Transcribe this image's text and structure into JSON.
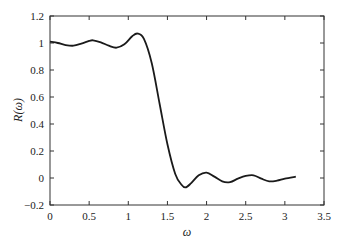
{
  "chart_data": {
    "type": "line",
    "title": "",
    "xlabel": "ω",
    "ylabel": "R(ω)",
    "xlim": [
      0,
      3.5
    ],
    "ylim": [
      -0.2,
      1.2
    ],
    "grid": false,
    "legend": null,
    "xticks": [
      0,
      0.5,
      1,
      1.5,
      2,
      2.5,
      3,
      3.5
    ],
    "xtick_labels": [
      "0",
      "0.5",
      "1",
      "1.5",
      "2",
      "2.5",
      "3",
      "3.5"
    ],
    "yticks": [
      -0.2,
      0,
      0.2,
      0.4,
      0.6,
      0.8,
      1,
      1.2
    ],
    "ytick_labels": [
      "−0.2",
      "0",
      "0.2",
      "0.4",
      "0.6",
      "0.8",
      "1",
      "1.2"
    ],
    "series": [
      {
        "name": "R(ω)",
        "color": "#1a1a1a",
        "x": [
          0,
          0.1,
          0.2,
          0.3,
          0.4,
          0.5,
          0.55,
          0.65,
          0.75,
          0.85,
          0.95,
          1.05,
          1.12,
          1.2,
          1.3,
          1.4,
          1.5,
          1.6,
          1.68,
          1.73,
          1.8,
          1.9,
          2.0,
          2.1,
          2.2,
          2.3,
          2.4,
          2.5,
          2.6,
          2.7,
          2.8,
          2.9,
          3.0,
          3.14
        ],
        "y": [
          1.01,
          1.0,
          0.985,
          0.98,
          0.995,
          1.015,
          1.02,
          1.005,
          0.98,
          0.965,
          0.99,
          1.05,
          1.07,
          1.03,
          0.85,
          0.55,
          0.25,
          0.03,
          -0.05,
          -0.07,
          -0.04,
          0.02,
          0.04,
          0.01,
          -0.025,
          -0.03,
          -0.005,
          0.015,
          0.02,
          -0.005,
          -0.025,
          -0.02,
          -0.005,
          0.01
        ]
      }
    ]
  }
}
